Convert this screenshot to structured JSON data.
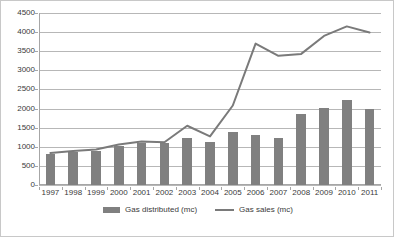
{
  "chart_data": {
    "type": "bar",
    "title": "",
    "subtitle": "",
    "xlabel": "",
    "ylabel": "",
    "ylim": [
      0,
      4500
    ],
    "ytick_step": 500,
    "yticks": [
      "0",
      "500",
      "1000",
      "1500",
      "2000",
      "2500",
      "3000",
      "3500",
      "4000",
      "4500"
    ],
    "grid": true,
    "legend_position": "bottom",
    "categories": [
      "1997",
      "1998",
      "1999",
      "2000",
      "2001",
      "2002",
      "2003",
      "2004",
      "2005",
      "2006",
      "2007",
      "2008",
      "2009",
      "2010",
      "2011"
    ],
    "series": [
      {
        "name": "Gas distributed (mc)",
        "type": "bar",
        "color": "#808080",
        "values": [
          820,
          870,
          890,
          1030,
          1100,
          1090,
          1230,
          1130,
          1390,
          1310,
          1230,
          1850,
          2020,
          2230,
          1990
        ]
      },
      {
        "name": "Gas sales (mc)",
        "type": "line",
        "color": "#7a7a7a",
        "values": [
          840,
          890,
          930,
          1060,
          1140,
          1120,
          1550,
          1270,
          2080,
          3700,
          3380,
          3430,
          3900,
          4150,
          3990
        ]
      }
    ]
  },
  "legend": {
    "entries": [
      {
        "label": "Gas distributed (mc)",
        "marker": "bar-swatch"
      },
      {
        "label": "Gas sales (mc)",
        "marker": "line-swatch"
      }
    ]
  },
  "colors": {
    "bar": "#808080",
    "line": "#7a7a7a",
    "grid": "#b7b7b7",
    "axis": "#a6a6a6",
    "frame": "#c8c8c8",
    "text": "#3a3a3a"
  }
}
